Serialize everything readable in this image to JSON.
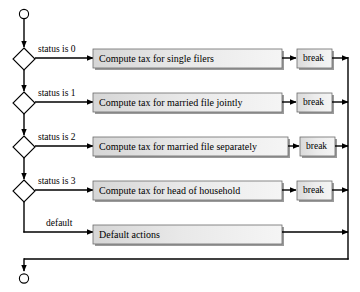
{
  "diagram": {
    "colors": {
      "stroke": "#000000",
      "box_fill_left": "#dcdcdc",
      "box_fill_right": "#f2f2f2",
      "box_shadow": "#8a8a8a",
      "background": "#ffffff"
    },
    "start_node": {
      "shape": "circle",
      "label": ""
    },
    "end_node": {
      "shape": "circle",
      "label": ""
    },
    "branches": [
      {
        "condition_label": "status is 0",
        "action_label": "Compute tax for single filers",
        "terminator_label": "break"
      },
      {
        "condition_label": "status is 1",
        "action_label": "Compute tax for married file jointly",
        "terminator_label": "break"
      },
      {
        "condition_label": "status is 2",
        "action_label": "Compute tax for married file separately",
        "terminator_label": "break"
      },
      {
        "condition_label": "status is 3",
        "action_label": "Compute tax for head of household",
        "terminator_label": "break"
      }
    ],
    "default_branch": {
      "condition_label": "default",
      "action_label": "Default actions"
    }
  }
}
